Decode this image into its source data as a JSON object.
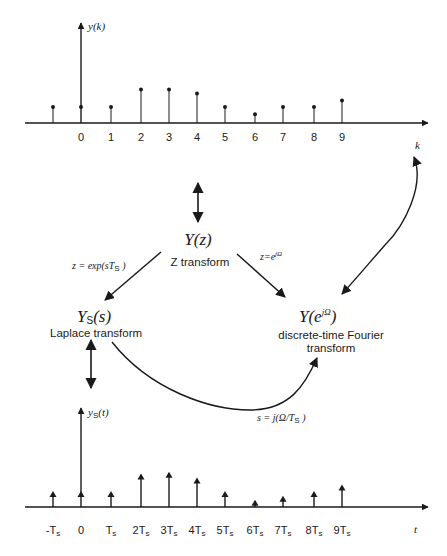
{
  "top_plot": {
    "y_label": "y(k)",
    "x_label": "k",
    "samples": [
      {
        "k": -1,
        "label": "",
        "value": 1.0
      },
      {
        "k": 0,
        "label": "0",
        "value": 1.0
      },
      {
        "k": 1,
        "label": "1",
        "value": 1.0
      },
      {
        "k": 2,
        "label": "2",
        "value": 2.1
      },
      {
        "k": 3,
        "label": "3",
        "value": 2.1
      },
      {
        "k": 4,
        "label": "4",
        "value": 1.85
      },
      {
        "k": 5,
        "label": "5",
        "value": 1.0
      },
      {
        "k": 6,
        "label": "6",
        "value": 0.55
      },
      {
        "k": 7,
        "label": "7",
        "value": 1.0
      },
      {
        "k": 8,
        "label": "8",
        "value": 1.0
      },
      {
        "k": 9,
        "label": "9",
        "value": 1.4
      }
    ]
  },
  "bottom_plot": {
    "y_label_main": "y",
    "y_label_sub": "S",
    "y_label_arg": "(t)",
    "x_label": "t",
    "impulses": [
      {
        "k": -1,
        "label": "-Ts",
        "value": 1.0
      },
      {
        "k": 0,
        "label": "0",
        "value": 1.0
      },
      {
        "k": 1,
        "label": "Ts",
        "value": 1.0
      },
      {
        "k": 2,
        "label": "2Ts",
        "value": 2.1
      },
      {
        "k": 3,
        "label": "3Ts",
        "value": 2.2
      },
      {
        "k": 4,
        "label": "4Ts",
        "value": 1.85
      },
      {
        "k": 5,
        "label": "5Ts",
        "value": 1.0
      },
      {
        "k": 6,
        "label": "6Ts",
        "value": 0.45
      },
      {
        "k": 7,
        "label": "7Ts",
        "value": 0.7
      },
      {
        "k": 8,
        "label": "8Ts",
        "value": 1.0
      },
      {
        "k": 9,
        "label": "9Ts",
        "value": 1.4
      }
    ]
  },
  "nodes": {
    "z": {
      "symbol": "Y(z)",
      "name": "Z transform"
    },
    "laplace": {
      "symbol_main": "Y",
      "symbol_sub": "S",
      "symbol_arg": "(s)",
      "name": "Laplace transform"
    },
    "dtft": {
      "symbol_main": "Y(e",
      "symbol_sup": "jΩ",
      "symbol_close": ")",
      "name_line1": "discrete-time Fourier",
      "name_line2": "transform"
    }
  },
  "equations": {
    "z_to_laplace_main": "z = exp(sT",
    "z_to_laplace_sub": "S",
    "z_to_laplace_close": " )",
    "z_to_dtft_main": "z=e",
    "z_to_dtft_sup": "jΩ",
    "laplace_to_dtft_main": "s = j(Ω/T",
    "laplace_to_dtft_sub": "S",
    "laplace_to_dtft_close": " )"
  }
}
